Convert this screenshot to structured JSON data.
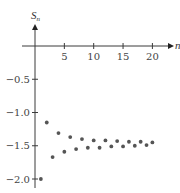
{
  "chart_data": {
    "type": "scatter",
    "title": "",
    "xlabel": "n",
    "ylabel": "S_n",
    "ylabel_main": "S",
    "ylabel_sub": "n",
    "x_ticks": [
      5,
      10,
      15,
      20
    ],
    "x_tick_labels": [
      "5",
      "10",
      "15",
      "20"
    ],
    "y_ticks": [
      -0.5,
      -1.0,
      -1.5,
      -2.0
    ],
    "y_tick_labels": [
      "−0.5",
      "−1.0",
      "−1.5",
      "−2.0"
    ],
    "xlim": [
      0,
      22
    ],
    "ylim": [
      -2.1,
      0.35
    ],
    "grid": false,
    "legend": null,
    "series": [
      {
        "name": "S_n",
        "color": "#555555",
        "x": [
          1,
          2,
          3,
          4,
          5,
          6,
          7,
          8,
          9,
          10,
          11,
          12,
          13,
          14,
          15,
          16,
          17,
          18,
          19,
          20
        ],
        "y": [
          -2.0,
          -1.15,
          -1.67,
          -1.31,
          -1.59,
          -1.37,
          -1.55,
          -1.4,
          -1.53,
          -1.42,
          -1.53,
          -1.42,
          -1.51,
          -1.43,
          -1.51,
          -1.44,
          -1.5,
          -1.44,
          -1.49,
          -1.45
        ]
      }
    ]
  }
}
